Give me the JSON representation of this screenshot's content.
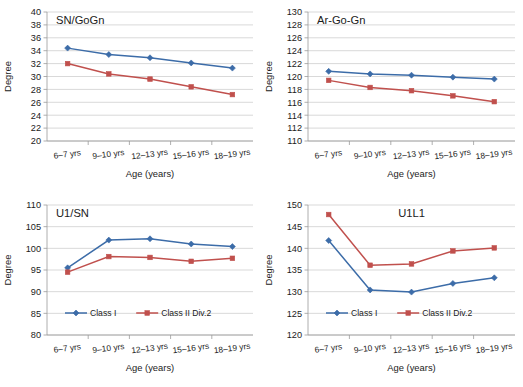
{
  "figure": {
    "series_names": [
      "Class I",
      "Class II Div.2"
    ],
    "series_colors": [
      "#3c6ca8",
      "#c0504d"
    ],
    "categories": [
      "6–7 yrs",
      "9–10 yrs",
      "12–13 yrs",
      "15–16 yrs",
      "18–19 yrs"
    ],
    "xlabel": "Age (years)",
    "ylabel": "Degree"
  },
  "chart_data": [
    {
      "type": "line",
      "title": "SN/GoGn",
      "title_align": "left",
      "xlabel": "Age (years)",
      "ylabel": "Degree",
      "categories": [
        "6–7 yrs",
        "9–10 yrs",
        "12–13 yrs",
        "15–16 yrs",
        "18–19 yrs"
      ],
      "ylim": [
        20,
        40
      ],
      "ytick_step": 2,
      "yticks": [
        20,
        22,
        24,
        26,
        28,
        30,
        32,
        34,
        36,
        38,
        40
      ],
      "grid": true,
      "legend": false,
      "series": [
        {
          "name": "Class I",
          "color": "#3c6ca8",
          "marker": "diamond",
          "values": [
            34.4,
            33.4,
            32.9,
            32.1,
            31.3
          ]
        },
        {
          "name": "Class II Div.2",
          "color": "#c0504d",
          "marker": "square",
          "values": [
            32.0,
            30.4,
            29.6,
            28.4,
            27.2
          ]
        }
      ]
    },
    {
      "type": "line",
      "title": "Ar-Go-Gn",
      "title_align": "left",
      "xlabel": "Age (years)",
      "ylabel": "Degree",
      "categories": [
        "6–7 yrs",
        "9–10 yrs",
        "12–13 yrs",
        "15–16 yrs",
        "18–19 yrs"
      ],
      "ylim": [
        110,
        130
      ],
      "ytick_step": 2,
      "yticks": [
        110,
        112,
        114,
        116,
        118,
        120,
        122,
        124,
        126,
        128,
        130
      ],
      "grid": true,
      "legend": false,
      "series": [
        {
          "name": "Class I",
          "color": "#3c6ca8",
          "marker": "diamond",
          "values": [
            120.8,
            120.4,
            120.2,
            119.9,
            119.6
          ]
        },
        {
          "name": "Class II Div.2",
          "color": "#c0504d",
          "marker": "square",
          "values": [
            119.4,
            118.3,
            117.8,
            117.0,
            116.1
          ]
        }
      ]
    },
    {
      "type": "line",
      "title": "U1/SN",
      "title_align": "left",
      "xlabel": "Age (years)",
      "ylabel": "Degree",
      "categories": [
        "6–7 yrs",
        "9–10 yrs",
        "12–13 yrs",
        "15–16 yrs",
        "18–19 yrs"
      ],
      "ylim": [
        80,
        110
      ],
      "ytick_step": 5,
      "yticks": [
        80,
        85,
        90,
        95,
        100,
        105,
        110
      ],
      "grid": true,
      "legend": true,
      "series": [
        {
          "name": "Class I",
          "color": "#3c6ca8",
          "marker": "diamond",
          "values": [
            95.5,
            101.9,
            102.2,
            101.0,
            100.4
          ]
        },
        {
          "name": "Class II Div.2",
          "color": "#c0504d",
          "marker": "square",
          "values": [
            94.5,
            98.1,
            97.9,
            97.0,
            97.7
          ]
        }
      ]
    },
    {
      "type": "line",
      "title": "U1L1",
      "title_align": "center",
      "xlabel": "Age (years)",
      "ylabel": "Degree",
      "categories": [
        "6–7 yrs",
        "9–10 yrs",
        "12–13 yrs",
        "15–16 yrs",
        "18–19 yrs"
      ],
      "ylim": [
        120,
        150
      ],
      "ytick_step": 5,
      "yticks": [
        120,
        125,
        130,
        135,
        140,
        145,
        150
      ],
      "grid": true,
      "legend": true,
      "series": [
        {
          "name": "Class I",
          "color": "#3c6ca8",
          "marker": "diamond",
          "values": [
            141.8,
            130.4,
            129.9,
            131.9,
            133.2
          ]
        },
        {
          "name": "Class II Div.2",
          "color": "#c0504d",
          "marker": "square",
          "values": [
            147.8,
            136.1,
            136.4,
            139.4,
            140.1
          ]
        }
      ]
    }
  ]
}
